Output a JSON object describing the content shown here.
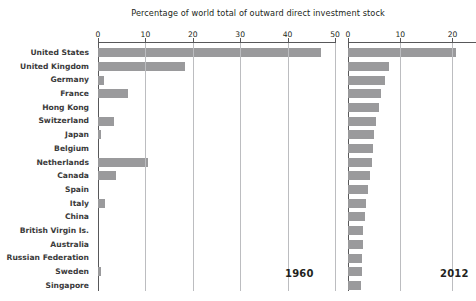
{
  "chart_data": {
    "type": "bar",
    "title": "Percentage of world total of outward direct investment stock",
    "xlabel": "",
    "ylabel": "",
    "orientation": "horizontal",
    "grid": true,
    "legend": "none",
    "panels": [
      {
        "name": "1960",
        "year_label": "1960",
        "xlim": [
          0,
          50
        ],
        "xticks": [
          0,
          10,
          20,
          30,
          40,
          50
        ],
        "xticklabels": [
          "0",
          "10",
          "20",
          "30",
          "40",
          "50"
        ]
      },
      {
        "name": "2012",
        "year_label": "2012",
        "xlim": [
          0,
          24.5
        ],
        "xticks": [
          0,
          10,
          20
        ],
        "xticklabels": [
          "0",
          "10",
          "20"
        ]
      }
    ],
    "categories": [
      "United States",
      "United Kingdom",
      "Germany",
      "France",
      "Hong Kong",
      "Switzerland",
      "Japan",
      "Belgium",
      "Netherlands",
      "Canada",
      "Spain",
      "Italy",
      "China",
      "British Virgin Is.",
      "Australia",
      "Russian Federation",
      "Sweden",
      "Singapore"
    ],
    "series": [
      {
        "name": "1960",
        "values": [
          47.1,
          18.3,
          1.2,
          6.4,
          0.0,
          3.4,
          0.7,
          0.0,
          10.5,
          3.7,
          0.0,
          1.5,
          0.0,
          0.0,
          0.0,
          0.0,
          0.6,
          0.0
        ]
      },
      {
        "name": "2012",
        "values": [
          20.6,
          7.8,
          7.0,
          6.4,
          5.9,
          5.3,
          5.0,
          4.8,
          4.6,
          4.2,
          3.8,
          3.4,
          3.2,
          2.9,
          2.8,
          2.7,
          2.6,
          2.5
        ]
      }
    ],
    "colors": {
      "bar": "#9a9a9c",
      "axis": "#58585a",
      "grid": "#bcbdc0",
      "label": "#3b3b3b",
      "background": "#ffffff"
    }
  }
}
